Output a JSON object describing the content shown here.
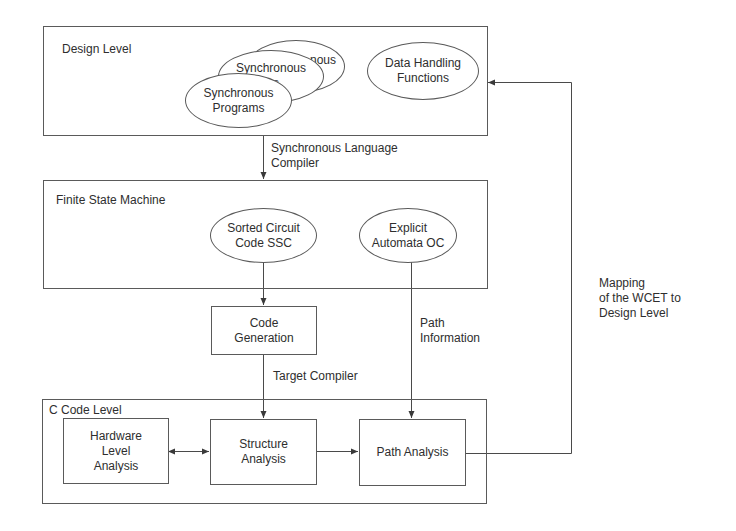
{
  "diagram": {
    "levels": {
      "design": {
        "title": "Design Level"
      },
      "fsm": {
        "title": "Finite State Machine"
      },
      "c_code": {
        "title": "C Code Level"
      }
    },
    "nodes": {
      "sync_programs_back": "Synchronous Programs",
      "sync_programs_mid": "Synchronous Programs",
      "sync_programs_front": "Synchronous\nPrograms",
      "data_handling": "Data Handling\nFunctions",
      "sorted_circuit": "Sorted Circuit\nCode SSC",
      "explicit_automata": "Explicit\nAutomata OC",
      "code_generation": "Code\nGeneration",
      "hardware_analysis": "Hardware\nLevel\nAnalysis",
      "structure_analysis": "Structure\nAnalysis",
      "path_analysis": "Path Analysis"
    },
    "edge_labels": {
      "sync_compiler": "Synchronous Language\nCompiler",
      "target_compiler": "Target Compiler",
      "path_information": "Path\nInformation",
      "mapping": "Mapping\nof the WCET to\nDesign Level"
    },
    "edges": [
      {
        "from": "Design Level",
        "to": "Finite State Machine",
        "label": "Synchronous Language Compiler"
      },
      {
        "from": "Sorted Circuit Code SSC",
        "to": "Code Generation"
      },
      {
        "from": "Code Generation",
        "to": "Structure Analysis",
        "label": "Target Compiler"
      },
      {
        "from": "Explicit Automata OC",
        "to": "Path Analysis",
        "label": "Path Information"
      },
      {
        "from": "Hardware Level Analysis",
        "to": "Structure Analysis",
        "bidirectional": true
      },
      {
        "from": "Structure Analysis",
        "to": "Path Analysis"
      },
      {
        "from": "Path Analysis",
        "to": "Design Level",
        "label": "Mapping of the WCET to Design Level"
      }
    ],
    "colors": {
      "line": "#4a4a4a",
      "text": "#2e2e2e",
      "background": "#ffffff"
    }
  }
}
